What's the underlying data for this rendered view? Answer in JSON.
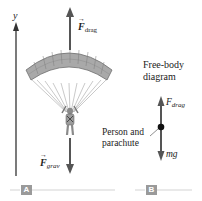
{
  "figure": {
    "panel_a": {
      "badge": "A",
      "axis_label": "y",
      "drag_force": {
        "symbol": "F",
        "subscript": "drag",
        "vector": true
      },
      "grav_force": {
        "symbol": "F",
        "subscript": "grav",
        "vector": true
      }
    },
    "panel_b": {
      "badge": "B",
      "title_line1": "Free-body",
      "title_line2": "diagram",
      "drag_force": {
        "symbol": "F",
        "subscript": "drag"
      },
      "weight_force": "mg",
      "body_label_line1": "Person and",
      "body_label_line2": "parachute"
    },
    "colors": {
      "arrow": "#555555",
      "canopy_fill": "#a8a8a8",
      "canopy_stroke": "#6e6e6e",
      "lines": "#9a9a9a",
      "badge": "#9a9a9a",
      "rule": "#cfcfcf",
      "dot": "#111111"
    }
  }
}
